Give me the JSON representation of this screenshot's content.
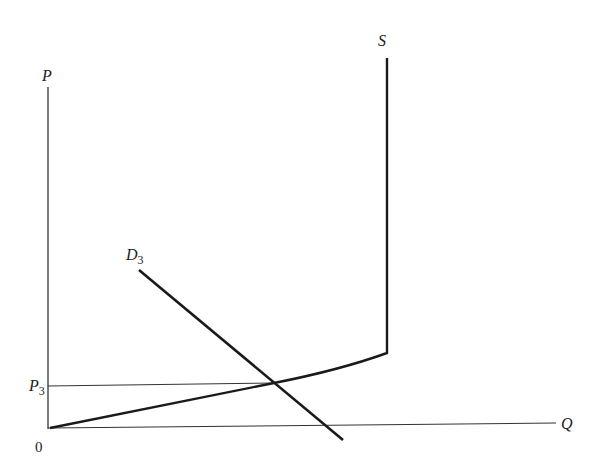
{
  "diagram": {
    "type": "supply-demand",
    "axes": {
      "y_label": "P",
      "x_label": "Q",
      "origin_label": "0"
    },
    "curves": {
      "supply": {
        "label": "S"
      },
      "demand": {
        "label": "D",
        "subscript": "3"
      }
    },
    "equilibrium": {
      "price_label": "P",
      "price_subscript": "3"
    },
    "colors": {
      "ink": "#222222",
      "background": "#ffffff"
    }
  }
}
